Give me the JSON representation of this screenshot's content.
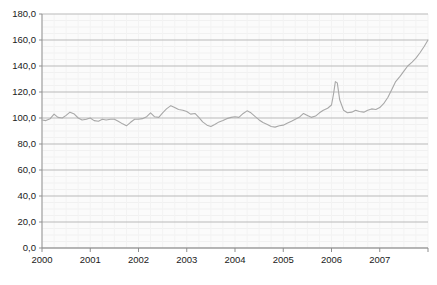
{
  "chart_data": {
    "type": "line",
    "title": "",
    "subtitle": "",
    "xlabel": "",
    "ylabel": "",
    "xlim": [
      2000.0,
      2008.0
    ],
    "ylim": [
      0.0,
      180.0
    ],
    "grid": true,
    "legend_position": "none",
    "y_ticks": [
      0.0,
      20.0,
      40.0,
      60.0,
      80.0,
      100.0,
      120.0,
      140.0,
      160.0,
      180.0
    ],
    "y_tick_labels": [
      "0,0",
      "20,0",
      "40,0",
      "60,0",
      "80,0",
      "100,0",
      "120,0",
      "140,0",
      "160,0",
      "180,0"
    ],
    "x_ticks": [
      2000,
      2001,
      2002,
      2003,
      2004,
      2005,
      2006,
      2007,
      2008
    ],
    "x_tick_labels": [
      "2000",
      "2001",
      "2002",
      "2003",
      "2004",
      "2005",
      "2006",
      "2007",
      ""
    ],
    "series": [
      {
        "name": "Index",
        "color": "#a8a8a8",
        "x": [
          2000.0,
          2000.08,
          2000.17,
          2000.25,
          2000.33,
          2000.42,
          2000.5,
          2000.58,
          2000.67,
          2000.75,
          2000.83,
          2000.92,
          2001.0,
          2001.08,
          2001.17,
          2001.25,
          2001.33,
          2001.42,
          2001.5,
          2001.58,
          2001.67,
          2001.75,
          2001.83,
          2001.92,
          2002.0,
          2002.08,
          2002.17,
          2002.25,
          2002.33,
          2002.42,
          2002.5,
          2002.58,
          2002.67,
          2002.75,
          2002.83,
          2002.92,
          2003.0,
          2003.08,
          2003.17,
          2003.25,
          2003.33,
          2003.42,
          2003.5,
          2003.58,
          2003.67,
          2003.75,
          2003.83,
          2003.92,
          2004.0,
          2004.08,
          2004.17,
          2004.25,
          2004.33,
          2004.42,
          2004.5,
          2004.58,
          2004.67,
          2004.75,
          2004.83,
          2004.92,
          2005.0,
          2005.08,
          2005.17,
          2005.25,
          2005.33,
          2005.42,
          2005.5,
          2005.58,
          2005.67,
          2005.75,
          2005.83,
          2005.92,
          2006.0,
          2006.04,
          2006.08,
          2006.12,
          2006.17,
          2006.25,
          2006.33,
          2006.42,
          2006.5,
          2006.58,
          2006.67,
          2006.75,
          2006.83,
          2006.92,
          2007.0,
          2007.08,
          2007.17,
          2007.25,
          2007.33,
          2007.42,
          2007.5,
          2007.58,
          2007.67,
          2007.75,
          2007.83,
          2007.92,
          2008.0
        ],
        "values": [
          98.5,
          98.0,
          99.5,
          103.0,
          100.5,
          100.0,
          102.0,
          104.5,
          103.0,
          100.0,
          98.5,
          99.0,
          100.0,
          98.0,
          97.5,
          99.0,
          98.5,
          99.0,
          99.0,
          97.5,
          95.5,
          94.0,
          96.5,
          99.0,
          99.0,
          99.5,
          101.0,
          104.0,
          101.0,
          100.5,
          104.0,
          107.0,
          109.5,
          108.0,
          106.5,
          106.0,
          105.0,
          103.0,
          103.5,
          100.5,
          97.0,
          94.5,
          93.5,
          95.0,
          97.0,
          98.0,
          99.5,
          100.5,
          101.0,
          100.5,
          103.5,
          105.5,
          104.0,
          101.0,
          98.5,
          96.5,
          95.0,
          93.5,
          93.0,
          94.0,
          94.5,
          96.0,
          97.5,
          99.0,
          100.5,
          103.5,
          102.0,
          100.5,
          101.5,
          104.0,
          106.0,
          107.5,
          110.0,
          118.0,
          128.0,
          127.0,
          114.0,
          106.0,
          104.0,
          104.5,
          106.0,
          105.0,
          104.5,
          106.0,
          107.0,
          106.5,
          108.0,
          111.0,
          116.0,
          122.0,
          128.0,
          132.0,
          136.0,
          140.0,
          143.0,
          146.0,
          150.0,
          155.0,
          160.0
        ]
      }
    ]
  }
}
